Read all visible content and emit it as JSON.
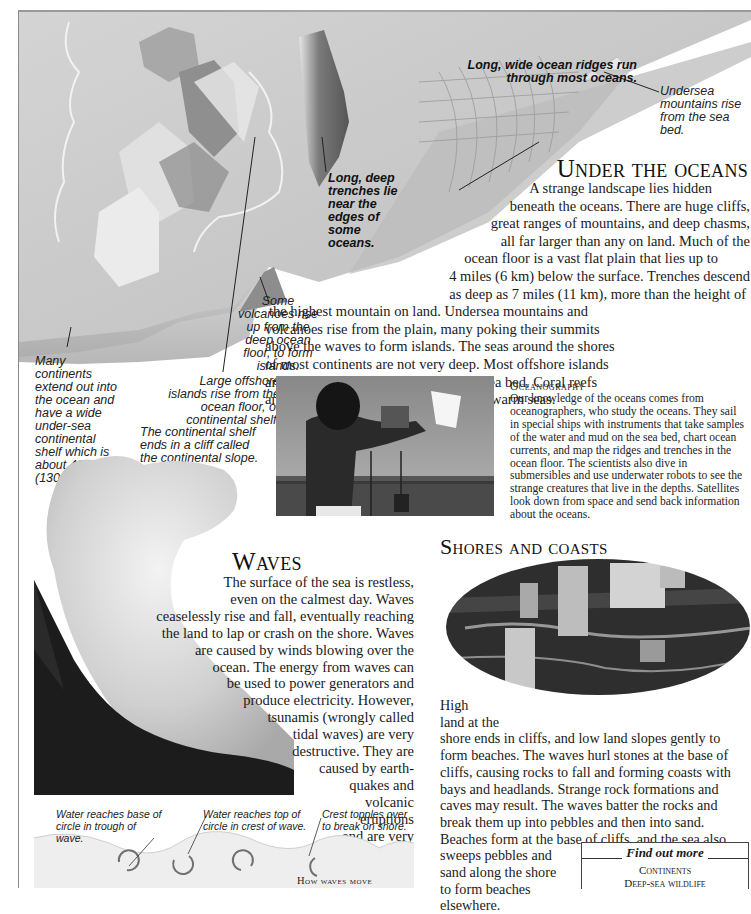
{
  "colors": {
    "background": "#ffffff",
    "text": "#1a1a1a",
    "seafloor_light": "#d9d9d9",
    "seafloor_mid": "#b8b8b8",
    "seafloor_dark": "#6e6e6e",
    "rule": "#8a8a8a"
  },
  "seafloor_illustration": {
    "callouts": {
      "ridges": "Long, wide ocean ridges run through most oceans.",
      "undersea_mountains": "Undersea mountains rise from the sea bed.",
      "trenches": "Long, deep trenches lie near the edges of some oceans.",
      "volcanoes": "Some volcanoes rise up from the deep ocean floor, to form islands.",
      "offshore_islands": "Large offshore islands rise from the ocean floor, or continental shelf.",
      "continental_shelf": "Many continents extend out into the ocean and have a wide under-sea continental shelf which is about 400 ft (130 m) deep.",
      "continental_slope": "The continental shelf ends in a cliff called the continental slope."
    }
  },
  "under_the_oceans": {
    "heading": "Under the oceans",
    "lines": [
      "A strange landscape lies hidden",
      "beneath the oceans. There are huge cliffs,",
      "great ranges of mountains, and deep chasms,",
      "all far larger than any on land. Much of the",
      "ocean floor is a vast flat plain that lies up to",
      "4 miles (6 km) below the surface. Trenches descend",
      "as deep as 7 miles (11 km), more than the height of",
      "the highest mountain on land. Undersea mountains and",
      "volcanoes rise from the plain, many poking their summits",
      "above the waves to form islands. The seas around the shores",
      "of most continents are not very deep. Most offshore islands",
      "are high land rising from the shallow sea bed. Coral reefs",
      "and atolls grow up from the sea bed in warm seas."
    ]
  },
  "oceanography": {
    "heading": "Oceanography",
    "text": "Our knowledge of the oceans comes from oceanographers, who study the oceans. They sail in special ships with instruments that take samples of the water and mud on the sea bed, chart ocean currents, and map the ridges and trenches in the ocean floor. The scientists also dive in submersibles and use underwater robots to see the strange creatures that live in the depths. Satellites look down from space and send back information about the oceans."
  },
  "waves": {
    "heading": "Waves",
    "lines": [
      "The surface of the sea is restless,",
      "even on the calmest day. Waves",
      "ceaselessly rise and fall, eventually reaching",
      "the land to lap or crash on the shore. Waves",
      "are caused by winds blowing over the",
      "ocean. The energy from waves can",
      "be used to power generators and",
      "produce electricity. However,",
      "tsunamis (wrongly called",
      "tidal waves) are very",
      "destructive. They are",
      "caused by earth-",
      "quakes and",
      "volcanic",
      "eruptions",
      "and are very",
      "powerful."
    ]
  },
  "shores_and_coasts": {
    "heading": "Shores and coasts",
    "lines": [
      "High",
      "land at the",
      "shore ends in cliffs, and low land slopes gently to",
      "form beaches. The waves hurl stones at the base of",
      "cliffs, causing rocks to fall and forming coasts with",
      "bays and headlands. Strange rock formations and",
      "caves may result. The waves batter the rocks and",
      "break them up into pebbles and then into sand.",
      "Beaches form at the base of cliffs, and the sea also",
      "sweeps pebbles and",
      "sand along the shore",
      "to form beaches",
      "elsewhere."
    ]
  },
  "how_waves_move": {
    "title": "How waves move",
    "labels": {
      "trough": "Water reaches base of circle in trough of wave.",
      "crest": "Water reaches top of circle in crest of wave.",
      "topples": "Crest topples over to break on shore."
    }
  },
  "find_out_more": {
    "title": "Find out more",
    "links": [
      "Continents",
      "Deep-sea wildlife"
    ]
  }
}
